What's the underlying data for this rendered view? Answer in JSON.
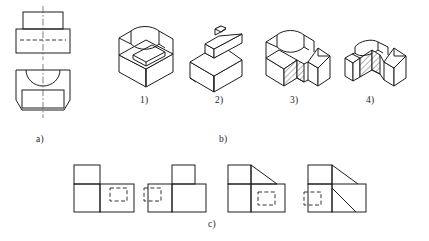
{
  "figure": {
    "background_color": "#ffffff",
    "line_color": "#1d1d1d",
    "centerline_color": "#4a4a4a"
  },
  "panels": {
    "a": {
      "label": "a)",
      "description": "Two orthographic views of the part: top view above, front view below, joined by a vertical centerline",
      "views": [
        {
          "name": "top-view",
          "features": [
            "outer rectangle",
            "inset upper rectangle",
            "horizontal hidden centerline",
            "vertical centerline"
          ]
        },
        {
          "name": "front-view",
          "features": [
            "outer outline with chamfered lower corners",
            "semicircular concave cut at top",
            "inner rectangle",
            "vertical centerline"
          ]
        }
      ]
    },
    "b": {
      "label": "b)",
      "description": "Four candidate isometric pictorials",
      "options": [
        {
          "label": "1)",
          "name": "isometric-option-1",
          "hatched": false
        },
        {
          "label": "2)",
          "name": "isometric-option-2",
          "hatched": false
        },
        {
          "label": "3)",
          "name": "isometric-option-3",
          "hatched": true
        },
        {
          "label": "4)",
          "name": "isometric-option-4",
          "hatched": true
        }
      ]
    },
    "c": {
      "label": "c)",
      "description": "Four candidate orthographic views with hidden lines",
      "options": [
        {
          "name": "ortho-option-1",
          "tab_side": "left",
          "hidden_rect": "right",
          "diagonals": 0
        },
        {
          "name": "ortho-option-2",
          "tab_side": "right",
          "hidden_rect": "left",
          "diagonals": 0
        },
        {
          "name": "ortho-option-3",
          "tab_side": "left",
          "hidden_rect": "right",
          "diagonals": 1
        },
        {
          "name": "ortho-option-4",
          "tab_side": "left",
          "hidden_rect": "left",
          "diagonals": 2
        }
      ]
    }
  }
}
